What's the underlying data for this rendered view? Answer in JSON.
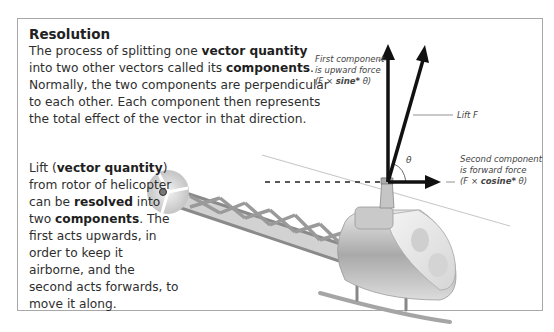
{
  "diagram": {
    "title": "Resolution",
    "intro": {
      "p1": "The process of splitting one ",
      "b1": "vector quantity",
      "p2": " into two other vectors called its ",
      "b2": "components",
      "p3": ". Normally, the two components are perpendicular to each other. Each component then represents the total effect of the vector in that direction."
    },
    "side": {
      "p1": "Lift (",
      "b1": "vector quantity",
      "p2": ") from rotor of helicopter can be ",
      "b2": "resolved",
      "p3": " into two ",
      "b3": "components",
      "p4": ". The first acts upwards, in order to keep it airborne, and the second acts forwards, to move it along."
    },
    "labels": {
      "first_component": {
        "line1": "First component",
        "line2": "is upward force",
        "formula_pre": "(F × ",
        "formula_bold": "sine*",
        "formula_post": " θ)"
      },
      "lift": "Lift F",
      "second_component": {
        "line1": "Second component",
        "line2": "is forward force",
        "formula_pre": "(F × ",
        "formula_bold": "cosine*",
        "formula_post": " θ)"
      },
      "angle": "θ"
    },
    "colors": {
      "arrow": "#111111",
      "frame": "#a8a8a8",
      "helicopter": "#b8b8b8"
    }
  }
}
